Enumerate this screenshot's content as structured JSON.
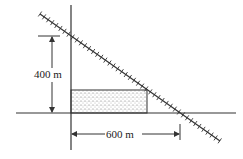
{
  "diagram": {
    "type": "geometry-figure",
    "elements": {
      "railroad": {
        "description": "diagonal railroad track line crossing axes"
      },
      "field": {
        "description": "stippled rectangular region in corner between axes and track"
      },
      "vertical_axis": {
        "description": "vertical road/axis"
      },
      "horizontal_axis": {
        "description": "horizontal road/axis"
      }
    },
    "labels": {
      "height": "400 m",
      "width": "600 m"
    },
    "colors": {
      "line": "#333333",
      "background": "#ffffff"
    }
  }
}
